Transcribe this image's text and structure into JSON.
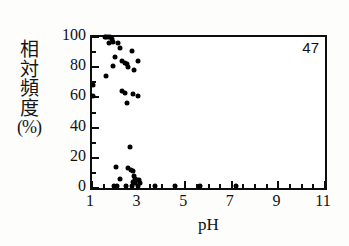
{
  "figure": {
    "annotation": "47",
    "ylabel_chars": [
      "相",
      "対",
      "頻",
      "度",
      "(%)"
    ],
    "xlabel": "pH"
  },
  "chart_data": {
    "type": "scatter",
    "title": "",
    "subtitle": "",
    "xlabel": "pH",
    "ylabel": "相対頻度 (%)",
    "ylabel_vertical_chars": [
      "相",
      "対",
      "頻",
      "度",
      "(%)"
    ],
    "xlim": [
      1,
      11
    ],
    "ylim": [
      0,
      100
    ],
    "xticks": [
      1,
      3,
      5,
      7,
      9,
      11
    ],
    "xtick_labels": [
      "1",
      "3",
      "5",
      "7",
      "9",
      "11"
    ],
    "xminor_step": 0.5,
    "yticks": [
      0,
      20,
      40,
      60,
      80,
      100
    ],
    "ytick_labels": [
      "0",
      "20",
      "40",
      "60",
      "80",
      "100"
    ],
    "yminor_step": 10,
    "grid": false,
    "legend": null,
    "annotations": [
      {
        "text": "47",
        "position": "top-right-inside"
      }
    ],
    "marker": {
      "shape": "circle",
      "color": "#000000",
      "size": 5
    },
    "n_points": 47,
    "points": [
      {
        "x": 1.55,
        "y": 100
      },
      {
        "x": 1.62,
        "y": 100
      },
      {
        "x": 1.7,
        "y": 100
      },
      {
        "x": 1.78,
        "y": 100
      },
      {
        "x": 1.84,
        "y": 99
      },
      {
        "x": 1.9,
        "y": 97
      },
      {
        "x": 1.74,
        "y": 96
      },
      {
        "x": 2.12,
        "y": 96
      },
      {
        "x": 2.2,
        "y": 93
      },
      {
        "x": 2.72,
        "y": 91
      },
      {
        "x": 1.98,
        "y": 87
      },
      {
        "x": 2.3,
        "y": 84
      },
      {
        "x": 2.4,
        "y": 83
      },
      {
        "x": 2.52,
        "y": 82
      },
      {
        "x": 2.96,
        "y": 84
      },
      {
        "x": 1.92,
        "y": 81
      },
      {
        "x": 2.55,
        "y": 80
      },
      {
        "x": 2.82,
        "y": 78
      },
      {
        "x": 1.62,
        "y": 74
      },
      {
        "x": 1.05,
        "y": 68
      },
      {
        "x": 1.05,
        "y": 61
      },
      {
        "x": 2.28,
        "y": 64
      },
      {
        "x": 2.4,
        "y": 63
      },
      {
        "x": 2.78,
        "y": 62
      },
      {
        "x": 2.98,
        "y": 61
      },
      {
        "x": 2.52,
        "y": 56
      },
      {
        "x": 2.62,
        "y": 27
      },
      {
        "x": 2.02,
        "y": 14
      },
      {
        "x": 2.55,
        "y": 13
      },
      {
        "x": 2.68,
        "y": 12
      },
      {
        "x": 2.74,
        "y": 11
      },
      {
        "x": 2.8,
        "y": 8
      },
      {
        "x": 2.22,
        "y": 6
      },
      {
        "x": 2.86,
        "y": 6
      },
      {
        "x": 2.92,
        "y": 5
      },
      {
        "x": 3.02,
        "y": 5
      },
      {
        "x": 2.76,
        "y": 4
      },
      {
        "x": 2.84,
        "y": 3
      },
      {
        "x": 3.08,
        "y": 3
      },
      {
        "x": 1.95,
        "y": 1
      },
      {
        "x": 2.06,
        "y": 1
      },
      {
        "x": 2.44,
        "y": 1
      },
      {
        "x": 2.72,
        "y": 1
      },
      {
        "x": 2.96,
        "y": 1
      },
      {
        "x": 3.7,
        "y": 1
      },
      {
        "x": 4.55,
        "y": 1
      },
      {
        "x": 5.62,
        "y": 1
      },
      {
        "x": 7.18,
        "y": 1
      }
    ]
  }
}
